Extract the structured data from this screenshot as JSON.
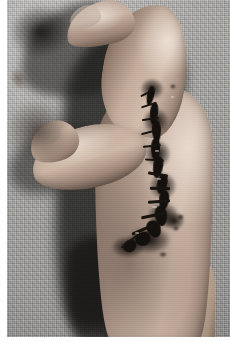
{
  "image": {
    "kind": "clinical-photograph",
    "subject": "human hand",
    "view": "radial / dorso-radial view of a hand, thumb to the left",
    "alt_text": "Clinical photograph of a hand showing a long sutured surgical wound with dark dried blood running from the index finger along the first web space down to the wrist, on a grey woven drape",
    "caption": "",
    "width_px": 230,
    "height_px": 343
  },
  "colors": {
    "background_cloth": "#a4a3a0",
    "cloth_highlight": "#c0bfbb",
    "cast_shadow": "#1a1918",
    "skin_highlight": "#d2bcab",
    "skin_midtone": "#b6a295",
    "skin_shadow": "#6d5a4e",
    "wound_crust": "#120f0d",
    "suture_thread": "#17130f",
    "print_margin": "#ffffff"
  },
  "regions": {
    "background": "woven grey surgical drape / cloth",
    "shadow": "dark cast shadow of the hand to the left",
    "index_finger": "index finger, flexed and curling down from the top",
    "index_nail": "index fingernail",
    "thumb": "thumb extended to the left",
    "thumb_nail": "thumbnail",
    "web_space": "first web space between thumb and index finger",
    "hand_body": "dorsum of the hand",
    "wrist": "wrist and distal forearm",
    "knuckle": "index metacarpophalangeal knuckle"
  },
  "wound": {
    "label": "sutured laceration with dried blood crust",
    "path_description": "runs from the proximal index finger, across the first web space and along the radial border of the hand to the wrist",
    "appearance": "dark black crusting with interrupted sutures",
    "segments": [
      {
        "x": 140,
        "y": 86,
        "w": 7,
        "h": 20,
        "rot": 12
      },
      {
        "x": 143,
        "y": 102,
        "w": 8,
        "h": 22,
        "rot": 6
      },
      {
        "x": 145,
        "y": 120,
        "w": 9,
        "h": 22,
        "rot": -3
      },
      {
        "x": 144,
        "y": 138,
        "w": 9,
        "h": 22,
        "rot": 2
      },
      {
        "x": 146,
        "y": 156,
        "w": 10,
        "h": 22,
        "rot": 8
      },
      {
        "x": 150,
        "y": 174,
        "w": 10,
        "h": 20,
        "rot": 14
      },
      {
        "x": 152,
        "y": 190,
        "w": 10,
        "h": 20,
        "rot": 6
      },
      {
        "x": 148,
        "y": 206,
        "w": 12,
        "h": 20,
        "rot": -6
      },
      {
        "x": 140,
        "y": 220,
        "w": 14,
        "h": 18,
        "rot": -22
      },
      {
        "x": 128,
        "y": 232,
        "w": 16,
        "h": 14,
        "rot": -34
      },
      {
        "x": 116,
        "y": 240,
        "w": 14,
        "h": 12,
        "rot": -44
      }
    ],
    "crusts": [
      {
        "x": 133,
        "y": 78,
        "w": 24,
        "h": 22
      },
      {
        "x": 136,
        "y": 108,
        "w": 26,
        "h": 26
      },
      {
        "x": 138,
        "y": 140,
        "w": 26,
        "h": 28
      },
      {
        "x": 142,
        "y": 172,
        "w": 28,
        "h": 28
      },
      {
        "x": 140,
        "y": 202,
        "w": 32,
        "h": 26
      },
      {
        "x": 120,
        "y": 226,
        "w": 44,
        "h": 28
      },
      {
        "x": 104,
        "y": 236,
        "w": 34,
        "h": 22
      },
      {
        "x": 156,
        "y": 212,
        "w": 22,
        "h": 18
      }
    ],
    "stitches": [
      {
        "x": 133,
        "y": 92,
        "w": 15,
        "h": 2.2,
        "rot": -26
      },
      {
        "x": 134,
        "y": 104,
        "w": 16,
        "h": 2.2,
        "rot": -18
      },
      {
        "x": 135,
        "y": 118,
        "w": 17,
        "h": 2.4,
        "rot": -8
      },
      {
        "x": 134,
        "y": 131,
        "w": 18,
        "h": 2.4,
        "rot": -14
      },
      {
        "x": 136,
        "y": 145,
        "w": 18,
        "h": 2.4,
        "rot": -6
      },
      {
        "x": 138,
        "y": 159,
        "w": 19,
        "h": 2.4,
        "rot": 4
      },
      {
        "x": 141,
        "y": 173,
        "w": 20,
        "h": 2.6,
        "rot": 10
      },
      {
        "x": 143,
        "y": 187,
        "w": 20,
        "h": 2.6,
        "rot": 2
      },
      {
        "x": 141,
        "y": 200,
        "w": 22,
        "h": 2.6,
        "rot": -4
      },
      {
        "x": 134,
        "y": 214,
        "w": 24,
        "h": 2.6,
        "rot": -12
      },
      {
        "x": 124,
        "y": 228,
        "w": 24,
        "h": 2.6,
        "rot": -24
      },
      {
        "x": 112,
        "y": 240,
        "w": 22,
        "h": 2.4,
        "rot": -38
      }
    ],
    "highlights": [
      {
        "x": 148,
        "y": 150,
        "w": 4,
        "h": 2
      },
      {
        "x": 150,
        "y": 178,
        "w": 4,
        "h": 2
      },
      {
        "x": 145,
        "y": 206,
        "w": 5,
        "h": 2
      },
      {
        "x": 128,
        "y": 232,
        "w": 4,
        "h": 2
      },
      {
        "x": 164,
        "y": 96,
        "w": 3,
        "h": 2
      }
    ],
    "satellite_marks": [
      {
        "x": 163,
        "y": 84,
        "w": 6,
        "h": 5
      },
      {
        "x": 170,
        "y": 214,
        "w": 7,
        "h": 6
      },
      {
        "x": 166,
        "y": 226,
        "w": 6,
        "h": 5
      },
      {
        "x": 152,
        "y": 252,
        "w": 8,
        "h": 5
      }
    ]
  }
}
